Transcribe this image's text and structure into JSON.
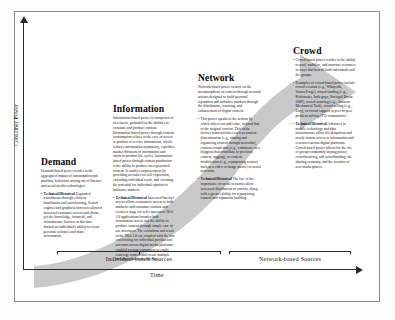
{
  "figure": {
    "axes": {
      "y_label": "Consumer Power",
      "x_label": "Time",
      "span_left": "Individual-based Sources",
      "span_right": "Network-based Sources"
    },
    "arrow": {
      "name": "progression-arrow",
      "color": "#c9c9c9",
      "direction": "lower-left-to-upper-right"
    },
    "stages": [
      {
        "id": "demand",
        "heading": "Demand",
        "intro": "Demand-based power resides in the aggregated impact of consumption and purchase behaviors arising out of Internet and social media technologies.",
        "bullets": [
          {
            "title": "Technical/Historical",
            "text": " Expanded assortments through efficient distribution and warehousing, Search engines and graphical browsers allowed increased consumer access and choice, yet the knowledge, financial, and infrastructure barriers at this time limited an individual's ability to create personal websites and share information."
          }
        ]
      },
      {
        "id": "information",
        "heading": "Information",
        "intro": "Information-based power is comprised of two facets, grounded in the abilities to consume and produce content. Information-based power through content consumption relates to the ease of access to product or service information, which reduces information asymmetry, expedites market diffusion of information and shortens product life cycles. Information-based power through content production is the ability to produce user-generated content. It enables empowerment by providing an outlet for self-expression, extending individual reach, and elevating the potential for individual opinion to influence markets.",
        "bullets": [
          {
            "title": "Technical/Historical",
            "text": " Increased Internet access allows consumers access to both marketer and consumer content and creates a stage for self-expression. Web 2.0 applications broaden both information access and the ability to produce content through simple ease of use interfaces. The evolutions and reach of the Web 1.0 era, coupled with the low cost hosting for individual profiles and accounts across digital media platforms enabled average consumers to easily converge content and create multiple presences across the Internet."
          }
        ]
      },
      {
        "id": "network",
        "heading": "Network",
        "intro": "Network-based power centers on the metamorphosis of content through network actions designed to build personal reputation and influence markets through the distribution, remixing, and enhancement of digital content.",
        "bullets": [
          {
            "title": "",
            "text": "This power speaks to the actions by which others can add value, beyond that of the original content. This value derives from activities such as content dissemination (e.g., sharing and organizing content through networks), content completion (e.g., comments on a blogpost that contribute to previous content, tagging), or content modification (e.g., repurposing content, such as a video or image meme) in social networks."
          },
          {
            "title": "Technical/Historical",
            "text": " The rise of the importance of social networks allow increased distribution of content, along with a greater ability for repurposing content and reputation building."
          }
        ]
      },
      {
        "id": "crowd",
        "heading": "Crowd",
        "intro": "",
        "bullets": [
          {
            "title": "",
            "text": "Crowd-based power resides in the ability to pool, mobilize, and structure resources in ways that benefit both individuals and the groups."
          },
          {
            "title": "",
            "text": "Examples of crowd-based power include crowd creation (e.g., Wikipedia, SourceForge), crowd funding (e.g., Kickstarter, Indiegogo, Sociogal Bryan 2009), crowd sourcing (e.g., Amazon Mechanical Turk), crowd-selling (e.g., Etsy), or crowd support (a peer-to-peer problem solving (P3) communities."
          },
          {
            "title": "Technical/Historical",
            "text": " Advances in mobile technology and data infrastructure allow for ubiquitous and nearly instant access to information and resources across digital platforms. Crowd-based power allows for the rise of group/community buying power, crowdsourcing, and crowdfunding, the sharing economy, and the creation of new marketplaces."
          }
        ]
      }
    ]
  }
}
